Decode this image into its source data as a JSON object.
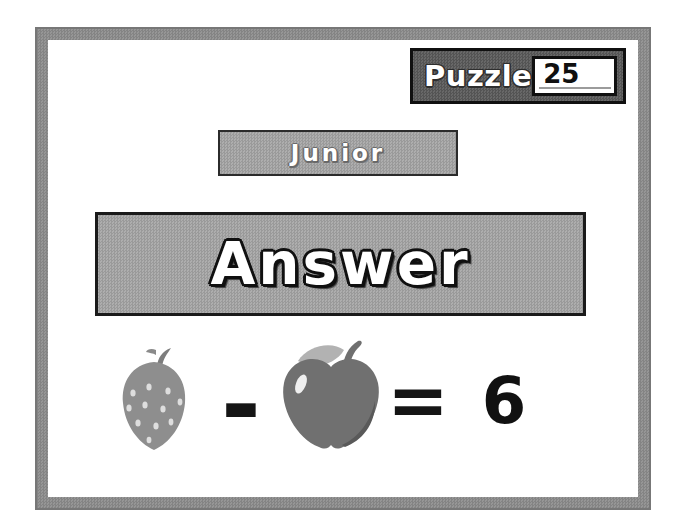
{
  "puzzle_panel": {
    "label": "Puzzle",
    "number_value": "25"
  },
  "level_banner": {
    "label": "Junior"
  },
  "answer_banner": {
    "label": "Answer"
  },
  "equation": {
    "left_operand": "strawberry",
    "operator": "-",
    "right_operand": "apple",
    "equals_sign": "=",
    "result": "6"
  },
  "colors": {
    "frame_gray": "#8d8d8d",
    "panel_dark_gray": "#5e5e5e",
    "banner_gray": "#a4a4a4",
    "text_white": "#ffffff",
    "ink_black": "#151515",
    "strawberry_gray": "#8e8e8e",
    "apple_gray": "#6e6e6e",
    "leaf_gray": "#b2b2b2"
  }
}
